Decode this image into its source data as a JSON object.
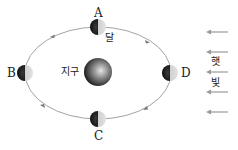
{
  "diagram": {
    "type": "moon-orbit-phases",
    "earth_label": "지구",
    "moon_label": "달",
    "sunlight_label": [
      "햇",
      "빛"
    ],
    "positions": [
      {
        "id": "A",
        "label": "A",
        "location": "top"
      },
      {
        "id": "B",
        "label": "B",
        "location": "left"
      },
      {
        "id": "C",
        "label": "C",
        "location": "bottom"
      },
      {
        "id": "D",
        "label": "D",
        "location": "right"
      }
    ],
    "orbit_direction": "counterclockwise",
    "sunlight_direction": "from right to left",
    "sunlight_arrow_count": 5,
    "colors": {
      "orbit": "#888888",
      "arrow": "#999999",
      "dark_side": "#1a1a1a",
      "lit_side": "#d8d8d8"
    }
  }
}
